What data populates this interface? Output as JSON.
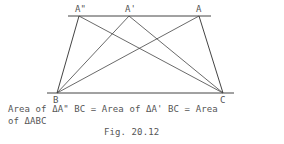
{
  "diagram": {
    "points": {
      "A2": {
        "label": "A\"",
        "x": 79,
        "y": 16
      },
      "A1": {
        "label": "A'",
        "x": 129,
        "y": 16
      },
      "A": {
        "label": "A",
        "x": 199,
        "y": 16
      },
      "B": {
        "label": "B",
        "x": 57,
        "y": 93
      },
      "C": {
        "label": "C",
        "x": 223,
        "y": 93
      }
    },
    "top_line": {
      "x1": 68,
      "x2": 211,
      "y": 16
    },
    "base_line": {
      "x1": 47,
      "x2": 234,
      "y": 93
    },
    "line_color": "#444444"
  },
  "caption": {
    "line1": "Area of ΔA\" BC = Area of ΔA' BC = Area",
    "line2": "of ΔABC",
    "figure": "Fig. 20.12"
  }
}
